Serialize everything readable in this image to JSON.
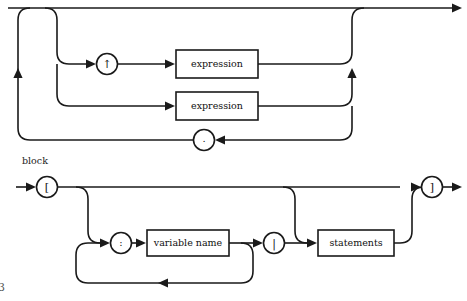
{
  "page": {
    "background_color": "#ffffff",
    "ink_color": "#1a1a1a",
    "folio": "3"
  },
  "diagrams": [
    {
      "id": "statements-fragment",
      "caption": "",
      "terminals": [
        {
          "name": "caret-terminal",
          "label": "↑"
        },
        {
          "name": "period-terminal",
          "label": "."
        }
      ],
      "nonterminals": [
        {
          "name": "expression-box-upper",
          "label": "expression"
        },
        {
          "name": "expression-box-lower",
          "label": "expression"
        }
      ]
    },
    {
      "id": "block",
      "caption": "block",
      "terminals": [
        {
          "name": "open-bracket-terminal",
          "label": "["
        },
        {
          "name": "colon-terminal",
          "label": ":"
        },
        {
          "name": "pipe-terminal",
          "label": "|"
        },
        {
          "name": "close-bracket-terminal",
          "label": "]"
        }
      ],
      "nonterminals": [
        {
          "name": "variable-name-box",
          "label": "variable name"
        },
        {
          "name": "statements-box",
          "label": "statements"
        }
      ]
    }
  ],
  "labels": {
    "expression_upper": "expression",
    "expression_lower": "expression",
    "caret": "↑",
    "period": ".",
    "block_caption": "block",
    "open_bracket": "[",
    "colon": ":",
    "variable_name": "variable name",
    "pipe": "|",
    "statements": "statements",
    "close_bracket": "]",
    "folio": "3"
  }
}
